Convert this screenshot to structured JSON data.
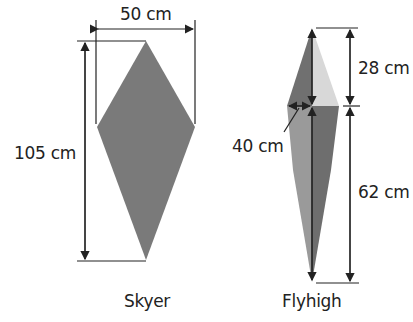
{
  "kites": [
    {
      "name": "Skyer",
      "width_label": "50 cm",
      "height_label": "105 cm"
    },
    {
      "name": "Flyhigh",
      "upper_label": "28 cm",
      "lower_label": "62 cm",
      "half_width_label": "40 cm"
    }
  ],
  "colors": {
    "skyer_fill": "#7a7a7a",
    "flyhigh_dark": "#707070",
    "flyhigh_light": "#d8d8d8",
    "flyhigh_mid": "#9a9a9a",
    "line": "#222222"
  }
}
